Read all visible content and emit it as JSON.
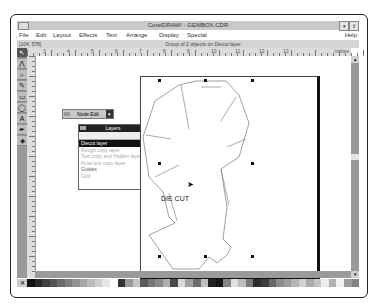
{
  "window": {
    "title": "CorelDRAW! - GEMBOX.CDR",
    "minimize_icon": "down-arrow-icon",
    "restore_icon": "updown-arrow-icon"
  },
  "menu": {
    "items": [
      "File",
      "Edit",
      "Layout",
      "Effects",
      "Text",
      "Arrange",
      "Display",
      "Special"
    ],
    "help": "Help"
  },
  "status": {
    "coords": "[104, 578]",
    "message": "Group of 2 objects on Diecut layer"
  },
  "toolbox": {
    "tools": [
      {
        "name": "pick-tool",
        "glyph": "↖"
      },
      {
        "name": "shape-tool",
        "glyph": "⋀"
      },
      {
        "name": "zoom-tool",
        "glyph": "⌕"
      },
      {
        "name": "pencil-tool",
        "glyph": "✎"
      },
      {
        "name": "rectangle-tool",
        "glyph": "▭"
      },
      {
        "name": "ellipse-tool",
        "glyph": "◯"
      },
      {
        "name": "text-tool",
        "glyph": "A"
      },
      {
        "name": "outline-tool",
        "glyph": "✒"
      },
      {
        "name": "fill-tool",
        "glyph": "◈"
      }
    ]
  },
  "ruler": {
    "labels": [
      "3",
      "4",
      "5",
      "6",
      "7",
      "8",
      "9",
      "10",
      "11",
      "12",
      "13"
    ],
    "unit": "inches"
  },
  "node_edit": {
    "title": "Node Edit",
    "button_glyph": "▾"
  },
  "layers_panel": {
    "title": "Layers",
    "menu_glyph": "▶",
    "items": [
      {
        "label": "Diecut layer",
        "state": "selected"
      },
      {
        "label": "Rough copy layer",
        "state": "dim"
      },
      {
        "label": "Text copy and Hidden layer",
        "state": "dim"
      },
      {
        "label": "Final text copy layer",
        "state": "dim"
      },
      {
        "label": "Guides",
        "state": "dark"
      },
      {
        "label": "Grid",
        "state": "dim"
      }
    ]
  },
  "drawing": {
    "annotation": "DIE CUT"
  },
  "palette": {
    "colors": [
      "#111111",
      "#2a2a2a",
      "#404040",
      "#555555",
      "#6a6a6a",
      "#7e7e7e",
      "#929292",
      "#a6a6a6",
      "#bababa",
      "#cecece",
      "#e6e6e6",
      "#ffffff",
      "#333333",
      "#9a9a9a",
      "#c4c4c4",
      "#5a5a5a",
      "#777777",
      "#8a8a8a",
      "#b0b0b0",
      "#4a4a4a",
      "#d8d8d8",
      "#a0a0a0",
      "#6c6c6c",
      "#c0c0c0",
      "#222222",
      "#151515",
      "#858585",
      "#e0e0e0",
      "#bdbdbd",
      "#7a7a7a",
      "#2e2e2e",
      "#3e3e3e",
      "#686868",
      "#8c8c8c",
      "#9e9e9e",
      "#b6b6b6",
      "#d2d2d2",
      "#aaaaaa",
      "#c6c6c6",
      "#ececec",
      "#b2b2b2",
      "#f2f2f2",
      "#9c9c9c",
      "#828282"
    ]
  }
}
